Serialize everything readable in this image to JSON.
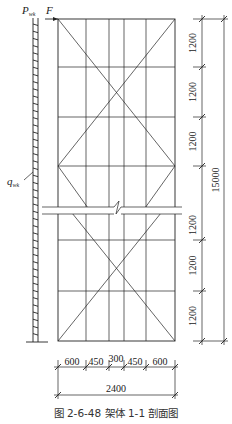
{
  "diagram": {
    "caption": "图 2-6-48   架体 1-1 剖面图",
    "loads": {
      "top_point_label": "P",
      "top_point_sub": "wk",
      "force_label": "F",
      "distributed_label": "q",
      "distributed_sub": "wk"
    },
    "vertical_dims": [
      "1200",
      "1200",
      "1200",
      "1200",
      "1200",
      "1200"
    ],
    "vertical_total": "15000",
    "horizontal_dims": [
      "600",
      "450",
      "300",
      "450",
      "600"
    ],
    "horizontal_total": "2400"
  }
}
